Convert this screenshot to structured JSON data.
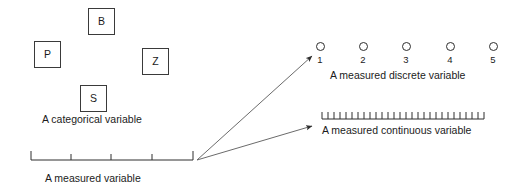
{
  "figure": {
    "width": 507,
    "height": 189,
    "background": "#ffffff",
    "ink_color": "#2e2e2e",
    "text_color": "#1b1b1b"
  },
  "categorical": {
    "caption": "A categorical variable",
    "caption_x": 42,
    "caption_y": 114,
    "boxes": [
      {
        "label": "P",
        "x": 34,
        "y": 41
      },
      {
        "label": "B",
        "x": 88,
        "y": 8
      },
      {
        "label": "Z",
        "x": 142,
        "y": 48
      },
      {
        "label": "S",
        "x": 80,
        "y": 85
      }
    ]
  },
  "measured_axis": {
    "caption": "A measured variable",
    "caption_x": 45,
    "caption_y": 173,
    "x_start": 31,
    "x_end": 193,
    "y": 160,
    "end_cap_height": 9,
    "tick_height": 6,
    "tick_positions": [
      71,
      111,
      152
    ]
  },
  "arrows": {
    "origin_x": 197,
    "origin_y": 160,
    "targets": [
      {
        "name": "to-discrete",
        "x": 312,
        "y": 56
      },
      {
        "name": "to-continuous",
        "x": 312,
        "y": 126
      }
    ]
  },
  "discrete": {
    "caption": "A measured discrete variable",
    "caption_x": 330,
    "caption_y": 70,
    "circle_y": 42,
    "number_y": 55,
    "items": [
      {
        "value": "1",
        "x": 320
      },
      {
        "value": "2",
        "x": 363
      },
      {
        "value": "3",
        "x": 406
      },
      {
        "value": "4",
        "x": 450
      },
      {
        "value": "5",
        "x": 493
      }
    ]
  },
  "continuous": {
    "caption": "A measured continuous variable",
    "caption_x": 322,
    "caption_y": 125,
    "ruler_y": 119,
    "x_start": 322,
    "x_end": 484,
    "tick_count": 28,
    "tick_height": 7
  }
}
